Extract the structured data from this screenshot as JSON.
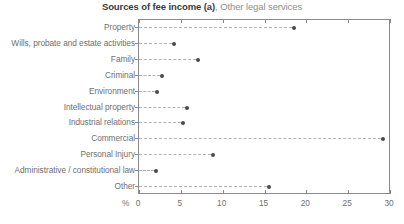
{
  "title": {
    "main": "Sources of fee income (a)",
    "sub": ", Other legal services"
  },
  "axis": {
    "unit_label": "%",
    "tick_labels": [
      "0",
      "5",
      "10",
      "15",
      "20",
      "25",
      "30"
    ]
  },
  "colors": {
    "dot": "#4a4a4a",
    "axis": "#8a8a8a",
    "leader": "#b4b4b4",
    "label_text": "#6f6f6f",
    "title_main": "#3b3b3b",
    "title_sub": "#8e8e8e",
    "background": "#ffffff"
  },
  "chart_data": {
    "type": "scatter",
    "title": "Sources of fee income (a), Other legal services",
    "xlabel": "%",
    "ylabel": "",
    "xlim": [
      0,
      30
    ],
    "xticks": [
      0,
      5,
      10,
      15,
      20,
      25,
      30
    ],
    "grid": false,
    "legend": "none",
    "orientation": "horizontal",
    "marker": "dot-with-dashed-leader",
    "categories": [
      "Property",
      "Wills, probate and estate activities",
      "Family",
      "Criminal",
      "Environment",
      "Intellectual property",
      "Industrial relations",
      "Commercial",
      "Personal Injury",
      "Administrative / constitutional law",
      "Other"
    ],
    "values": [
      18.5,
      4.2,
      7.1,
      2.7,
      2.1,
      5.7,
      5.2,
      29.2,
      8.8,
      2.0,
      15.5
    ]
  }
}
